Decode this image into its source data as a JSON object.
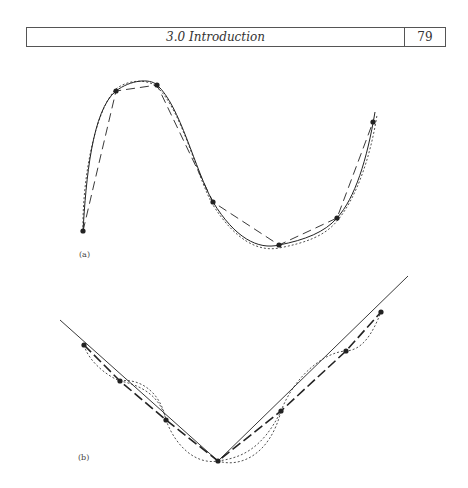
{
  "header": {
    "section_title": "3.0 Introduction",
    "page_number": "79"
  },
  "figure_a": {
    "label": "(a)",
    "points": [
      [
        83,
        231
      ],
      [
        116,
        91
      ],
      [
        157,
        85
      ],
      [
        213,
        202
      ],
      [
        279,
        245
      ],
      [
        337,
        218
      ],
      [
        373,
        122
      ]
    ]
  },
  "figure_b": {
    "label": "(b)",
    "points": [
      [
        84,
        345
      ],
      [
        120,
        381
      ],
      [
        166,
        420
      ],
      [
        218,
        461
      ],
      [
        281,
        411
      ],
      [
        346,
        351
      ],
      [
        381,
        312
      ]
    ]
  }
}
